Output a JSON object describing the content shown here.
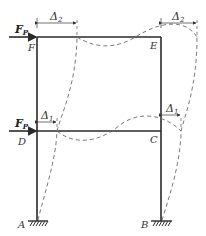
{
  "diagram": {
    "type": "two-story portal frame deflected shape",
    "nodes": {
      "A": "A",
      "B": "B",
      "C": "C",
      "D": "D",
      "E": "E",
      "F": "F"
    },
    "loads": {
      "top": {
        "symbol": "F",
        "subscript": "P"
      },
      "bottom": {
        "symbol": "F",
        "subscript": "P"
      }
    },
    "displacements": {
      "top_left": {
        "symbol": "Δ",
        "subscript": "2"
      },
      "top_right": {
        "symbol": "Δ",
        "subscript": "2"
      },
      "bottom_left": {
        "symbol": "Δ",
        "subscript": "1"
      },
      "bottom_right": {
        "symbol": "Δ",
        "subscript": "1"
      }
    },
    "colors": {
      "member": "#2a2a2a",
      "deflected": "#6a6a6a",
      "label": "#333333"
    }
  }
}
